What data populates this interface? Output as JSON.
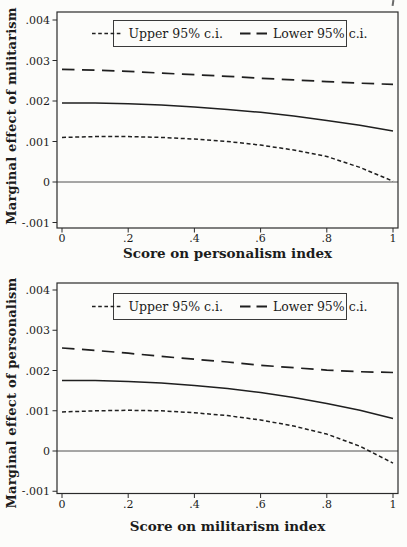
{
  "page": {
    "background": "#fcfcfa",
    "line_color": "#1f1f1f",
    "frame_color": "#2a2a2a"
  },
  "chart_data": [
    {
      "type": "line",
      "title": "",
      "xlabel": "Score on personalism index",
      "ylabel": "Marginal effect of militarism",
      "xlim": [
        0,
        1
      ],
      "ylim": [
        -0.001,
        0.004
      ],
      "grid": false,
      "zero_line": true,
      "legend_position": "top-center-inside-framed-box",
      "x_ticks": [
        {
          "v": 0,
          "label": "0"
        },
        {
          "v": 0.2,
          "label": ".2"
        },
        {
          "v": 0.4,
          "label": ".4"
        },
        {
          "v": 0.6,
          "label": ".6"
        },
        {
          "v": 0.8,
          "label": ".8"
        },
        {
          "v": 1,
          "label": "1"
        }
      ],
      "y_ticks": [
        {
          "v": -0.001,
          "label": "-.001"
        },
        {
          "v": 0,
          "label": "0"
        },
        {
          "v": 0.001,
          "label": ".001"
        },
        {
          "v": 0.002,
          "label": ".002"
        },
        {
          "v": 0.003,
          "label": ".003"
        },
        {
          "v": 0.004,
          "label": ".004"
        }
      ],
      "legend": [
        {
          "label": "Upper 95% c.i.",
          "dash": "short"
        },
        {
          "label": "Lower 95% c.i.",
          "dash": "long"
        }
      ],
      "x": [
        0,
        0.1,
        0.2,
        0.3,
        0.4,
        0.5,
        0.6,
        0.7,
        0.8,
        0.9,
        1.0
      ],
      "series": [
        {
          "name": "Lower 95% c.i.",
          "dash": "long",
          "values": [
            0.00278,
            0.00276,
            0.00273,
            0.00269,
            0.00265,
            0.00261,
            0.00256,
            0.00252,
            0.00248,
            0.00244,
            0.00241
          ]
        },
        {
          "name": "Point estimate",
          "dash": "solid",
          "values": [
            0.00195,
            0.00195,
            0.00193,
            0.0019,
            0.00185,
            0.00179,
            0.00172,
            0.00163,
            0.00152,
            0.0014,
            0.00126
          ]
        },
        {
          "name": "Upper 95% c.i.",
          "dash": "short",
          "values": [
            0.0011,
            0.00112,
            0.00112,
            0.0011,
            0.00106,
            0.001,
            0.00091,
            0.00079,
            0.00063,
            0.00036,
            2e-05
          ]
        }
      ]
    },
    {
      "type": "line",
      "title": "",
      "xlabel": "Score on militarism index",
      "ylabel": "Marginal effect of personalism",
      "xlim": [
        0,
        1
      ],
      "ylim": [
        -0.001,
        0.004
      ],
      "grid": false,
      "zero_line": true,
      "legend_position": "top-center-inside-framed-box",
      "x_ticks": [
        {
          "v": 0,
          "label": "0"
        },
        {
          "v": 0.2,
          "label": ".2"
        },
        {
          "v": 0.4,
          "label": ".4"
        },
        {
          "v": 0.6,
          "label": ".6"
        },
        {
          "v": 0.8,
          "label": ".8"
        },
        {
          "v": 1,
          "label": "1"
        }
      ],
      "y_ticks": [
        {
          "v": -0.001,
          "label": "-.001"
        },
        {
          "v": 0,
          "label": "0"
        },
        {
          "v": 0.001,
          "label": ".001"
        },
        {
          "v": 0.002,
          "label": ".002"
        },
        {
          "v": 0.003,
          "label": ".003"
        },
        {
          "v": 0.004,
          "label": ".004"
        }
      ],
      "legend": [
        {
          "label": "Upper 95% c.i.",
          "dash": "short"
        },
        {
          "label": "Lower 95% c.i.",
          "dash": "long"
        }
      ],
      "x": [
        0,
        0.1,
        0.2,
        0.3,
        0.4,
        0.5,
        0.6,
        0.7,
        0.8,
        0.9,
        1.0
      ],
      "series": [
        {
          "name": "Lower 95% c.i.",
          "dash": "long",
          "values": [
            0.00256,
            0.0025,
            0.00243,
            0.00235,
            0.00228,
            0.00221,
            0.00213,
            0.00207,
            0.00201,
            0.00197,
            0.00195
          ]
        },
        {
          "name": "Point estimate",
          "dash": "solid",
          "values": [
            0.00175,
            0.00175,
            0.00173,
            0.00169,
            0.00163,
            0.00155,
            0.00145,
            0.00133,
            0.00118,
            0.00101,
            0.00081
          ]
        },
        {
          "name": "Upper 95% c.i.",
          "dash": "short",
          "values": [
            0.00097,
            0.001,
            0.00101,
            0.001,
            0.00095,
            0.00088,
            0.00077,
            0.00062,
            0.00042,
            0.00012,
            -0.0003
          ]
        }
      ]
    }
  ]
}
